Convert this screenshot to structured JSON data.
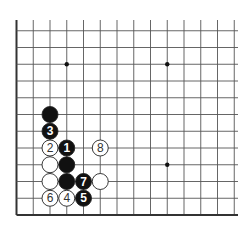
{
  "diagram": {
    "type": "go-board-corner",
    "corner": "bottom-left",
    "colors": {
      "line": "#555555",
      "edge": "#333333",
      "black": "#111111",
      "white": "#ffffff",
      "black_label": "#ffffff",
      "white_label": "#333333"
    },
    "grid": {
      "origin_x": 16.5,
      "bottom_y": 215,
      "spacing": 16.75,
      "cols": 14,
      "rows": 12,
      "top_y": 20,
      "right_x": 238
    },
    "star_points": [
      {
        "col": 3,
        "row": 9
      },
      {
        "col": 9,
        "row": 9
      },
      {
        "col": 9,
        "row": 3
      }
    ],
    "stones": [
      {
        "col": 2,
        "row": 6,
        "color": "black",
        "label": ""
      },
      {
        "col": 2,
        "row": 5,
        "color": "black",
        "label": "3"
      },
      {
        "col": 2,
        "row": 4,
        "color": "white",
        "label": "2"
      },
      {
        "col": 3,
        "row": 4,
        "color": "black",
        "label": "1"
      },
      {
        "col": 5,
        "row": 4,
        "color": "white",
        "label": "8"
      },
      {
        "col": 2,
        "row": 3,
        "color": "white",
        "label": ""
      },
      {
        "col": 3,
        "row": 3,
        "color": "black",
        "label": ""
      },
      {
        "col": 2,
        "row": 2,
        "color": "white",
        "label": ""
      },
      {
        "col": 3,
        "row": 2,
        "color": "black",
        "label": ""
      },
      {
        "col": 4,
        "row": 2,
        "color": "black",
        "label": "7"
      },
      {
        "col": 5,
        "row": 2,
        "color": "white",
        "label": ""
      },
      {
        "col": 2,
        "row": 1,
        "color": "white",
        "label": "6"
      },
      {
        "col": 3,
        "row": 1,
        "color": "white",
        "label": "4"
      },
      {
        "col": 4,
        "row": 1,
        "color": "black",
        "label": "5"
      }
    ]
  }
}
